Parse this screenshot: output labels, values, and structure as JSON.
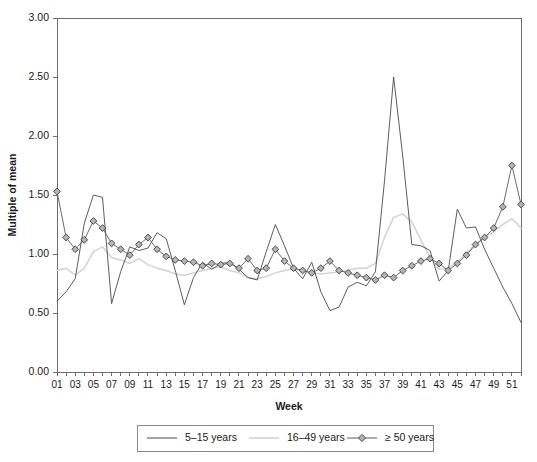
{
  "chart_data": {
    "type": "line",
    "title": "",
    "xlabel": "Week",
    "ylabel": "Multiple of mean",
    "xlim": [
      1,
      52
    ],
    "ylim": [
      0.0,
      3.0
    ],
    "yticks": [
      "0.00",
      "0.50",
      "1.00",
      "1.50",
      "2.00",
      "2.50",
      "3.00"
    ],
    "ytick_values": [
      0.0,
      0.5,
      1.0,
      1.5,
      2.0,
      2.5,
      3.0
    ],
    "x": [
      1,
      2,
      3,
      4,
      5,
      6,
      7,
      8,
      9,
      10,
      11,
      12,
      13,
      14,
      15,
      16,
      17,
      18,
      19,
      20,
      21,
      22,
      23,
      24,
      25,
      26,
      27,
      28,
      29,
      30,
      31,
      32,
      33,
      34,
      35,
      36,
      37,
      38,
      39,
      40,
      41,
      42,
      43,
      44,
      45,
      46,
      47,
      48,
      49,
      50,
      51,
      52
    ],
    "xtick_labels": [
      "01",
      "03",
      "05",
      "07",
      "09",
      "11",
      "13",
      "15",
      "17",
      "19",
      "21",
      "23",
      "25",
      "27",
      "29",
      "31",
      "33",
      "35",
      "37",
      "39",
      "41",
      "43",
      "45",
      "47",
      "49",
      "51"
    ],
    "xtick_label_weeks": [
      1,
      3,
      5,
      7,
      9,
      11,
      13,
      15,
      17,
      19,
      21,
      23,
      25,
      27,
      29,
      31,
      33,
      35,
      37,
      39,
      41,
      43,
      45,
      47,
      49,
      51
    ],
    "grid": false,
    "legend_position": "bottom",
    "series": [
      {
        "name": "5–15 years",
        "key": "a",
        "color": "#4a4a4a",
        "marker": "none",
        "values": [
          0.6,
          0.68,
          0.79,
          1.26,
          1.5,
          1.48,
          0.58,
          0.85,
          1.06,
          1.03,
          1.05,
          1.18,
          1.13,
          0.86,
          0.57,
          0.8,
          0.93,
          0.87,
          0.92,
          0.93,
          0.87,
          0.8,
          0.78,
          1.02,
          1.25,
          1.07,
          0.88,
          0.79,
          0.93,
          0.68,
          0.52,
          0.55,
          0.72,
          0.76,
          0.73,
          0.85,
          1.62,
          2.5,
          1.83,
          1.08,
          1.07,
          1.03,
          0.77,
          0.86,
          1.38,
          1.22,
          1.23,
          1.04,
          0.88,
          0.72,
          0.58,
          0.42
        ]
      },
      {
        "name": "16–49 years",
        "key": "b",
        "color": "#d2d2d2",
        "marker": "none",
        "values": [
          0.86,
          0.88,
          0.82,
          0.88,
          1.02,
          1.06,
          0.97,
          0.95,
          0.92,
          0.96,
          0.91,
          0.88,
          0.86,
          0.83,
          0.82,
          0.84,
          0.86,
          0.88,
          0.89,
          0.86,
          0.84,
          0.8,
          0.79,
          0.81,
          0.84,
          0.86,
          0.87,
          0.86,
          0.84,
          0.83,
          0.84,
          0.85,
          0.86,
          0.88,
          0.88,
          0.92,
          1.14,
          1.31,
          1.34,
          1.27,
          1.12,
          0.97,
          0.87,
          0.88,
          0.93,
          1.01,
          1.08,
          1.14,
          1.19,
          1.25,
          1.3,
          1.22
        ]
      },
      {
        "name": "≥ 50 years",
        "key": "c",
        "color": "#5a5a5a",
        "marker": "diamond",
        "values": [
          1.53,
          1.14,
          1.04,
          1.12,
          1.28,
          1.22,
          1.09,
          1.04,
          0.99,
          1.08,
          1.14,
          1.04,
          0.98,
          0.95,
          0.94,
          0.93,
          0.9,
          0.92,
          0.91,
          0.92,
          0.88,
          0.96,
          0.86,
          0.88,
          1.04,
          0.94,
          0.88,
          0.86,
          0.84,
          0.88,
          0.94,
          0.86,
          0.84,
          0.82,
          0.8,
          0.78,
          0.82,
          0.8,
          0.86,
          0.9,
          0.94,
          0.96,
          0.92,
          0.86,
          0.92,
          0.99,
          1.08,
          1.14,
          1.22,
          1.4,
          1.75,
          1.42
        ]
      }
    ]
  },
  "legend": {
    "items": [
      {
        "label": "5–15 years",
        "key": "a"
      },
      {
        "label": "16–49 years",
        "key": "b"
      },
      {
        "label": "≥ 50 years",
        "key": "c"
      }
    ]
  }
}
